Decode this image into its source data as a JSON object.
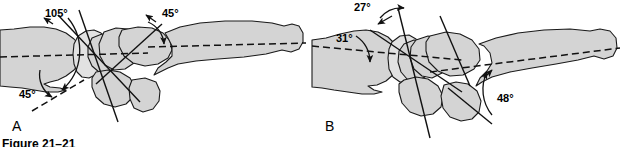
{
  "figure": {
    "caption": "Figure 21–21",
    "panels": [
      {
        "letter": "A",
        "name": "panel-a",
        "angles": [
          {
            "id": "a-105",
            "value": "105°"
          },
          {
            "id": "a-45-left",
            "value": "45°"
          },
          {
            "id": "a-45-right",
            "value": "45°"
          }
        ]
      },
      {
        "letter": "B",
        "name": "panel-b",
        "angles": [
          {
            "id": "b-27",
            "value": "27°"
          },
          {
            "id": "b-31",
            "value": "31°"
          },
          {
            "id": "b-48",
            "value": "48°"
          }
        ]
      }
    ]
  },
  "colors": {
    "bone_fill": "#d4d4d4",
    "bone_fill_light": "#e2e2e2",
    "outline": "#1a1a1a",
    "axis": "#111111",
    "background": "#ffffff"
  }
}
